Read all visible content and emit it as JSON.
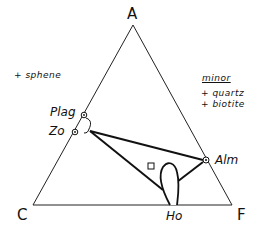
{
  "diagram": {
    "type": "ACF ternary phase diagram",
    "vertices": {
      "top": "A",
      "left": "C",
      "right": "F"
    },
    "phases": [
      {
        "name": "Plag",
        "x": 84,
        "y": 115
      },
      {
        "name": "Zo",
        "x": 75,
        "y": 132
      },
      {
        "name": "Alm",
        "x": 206,
        "y": 160
      },
      {
        "name": "Ho",
        "x": 174,
        "y": 205
      }
    ],
    "tie_lines": [
      [
        "Zo",
        "Alm"
      ],
      [
        "Zo",
        "Ho"
      ],
      [
        "Ho",
        "Alm"
      ]
    ],
    "bulk_composition_marker": {
      "shape": "square",
      "x": 151,
      "y": 166
    },
    "additional_phases": "+ sphene",
    "minor": {
      "title": "minor",
      "items": [
        "+ quartz",
        "+ biotite"
      ]
    }
  },
  "colors": {
    "line": "#111111",
    "background": "#ffffff"
  }
}
